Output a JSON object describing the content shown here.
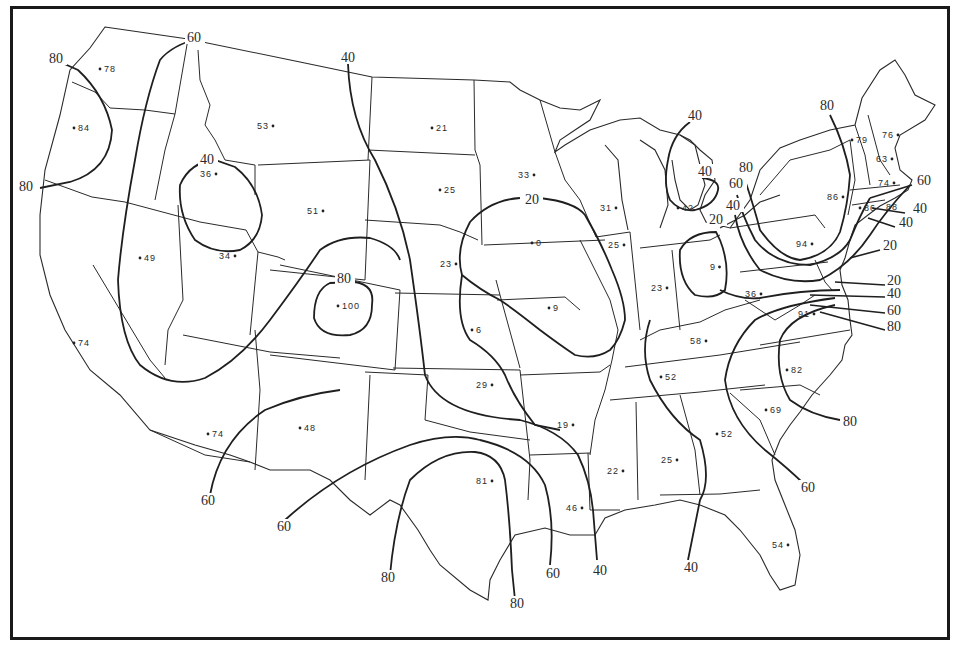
{
  "map": {
    "title": "",
    "contour_interval": 20,
    "contour_levels": [
      20,
      40,
      60,
      80,
      100
    ],
    "state_values": [
      {
        "state": "Washington",
        "value": "78",
        "x": 104,
        "y": 72,
        "dot": "left"
      },
      {
        "state": "Oregon",
        "value": "84",
        "x": 78,
        "y": 131,
        "dot": "left"
      },
      {
        "state": "California",
        "value": "74",
        "x": 78,
        "y": 346,
        "dot": "left"
      },
      {
        "state": "Nevada",
        "value": "49",
        "x": 144,
        "y": 261,
        "dot": "left"
      },
      {
        "state": "Idaho",
        "value": "36",
        "x": 200,
        "y": 177,
        "dot": "right"
      },
      {
        "state": "Montana",
        "value": "53",
        "x": 257,
        "y": 129,
        "dot": "right"
      },
      {
        "state": "Utah",
        "value": "34",
        "x": 219,
        "y": 259,
        "dot": "right"
      },
      {
        "state": "Wyoming",
        "value": "51",
        "x": 307,
        "y": 214,
        "dot": "right"
      },
      {
        "state": "Colorado",
        "value": "100",
        "x": 342,
        "y": 309,
        "dot": "left"
      },
      {
        "state": "Arizona",
        "value": "74",
        "x": 212,
        "y": 437,
        "dot": "left"
      },
      {
        "state": "New Mexico",
        "value": "48",
        "x": 304,
        "y": 431,
        "dot": "left"
      },
      {
        "state": "North Dakota",
        "value": "21",
        "x": 436,
        "y": 131,
        "dot": "left"
      },
      {
        "state": "South Dakota",
        "value": "25",
        "x": 444,
        "y": 193,
        "dot": "left"
      },
      {
        "state": "Nebraska",
        "value": "23",
        "x": 440,
        "y": 267,
        "dot": "right"
      },
      {
        "state": "Kansas",
        "value": "6",
        "x": 476,
        "y": 333,
        "dot": "left"
      },
      {
        "state": "Oklahoma",
        "value": "29",
        "x": 476,
        "y": 388,
        "dot": "right"
      },
      {
        "state": "Texas",
        "value": "81",
        "x": 476,
        "y": 484,
        "dot": "right"
      },
      {
        "state": "Minnesota",
        "value": "33",
        "x": 518,
        "y": 178,
        "dot": "right"
      },
      {
        "state": "Iowa",
        "value": "0",
        "x": 536,
        "y": 246,
        "dot": "left"
      },
      {
        "state": "Missouri",
        "value": "9",
        "x": 553,
        "y": 311,
        "dot": "left"
      },
      {
        "state": "Arkansas",
        "value": "19",
        "x": 557,
        "y": 428,
        "dot": "right"
      },
      {
        "state": "Louisiana",
        "value": "46",
        "x": 566,
        "y": 511,
        "dot": "right"
      },
      {
        "state": "Wisconsin",
        "value": "31",
        "x": 600,
        "y": 211,
        "dot": "right"
      },
      {
        "state": "Illinois",
        "value": "25",
        "x": 608,
        "y": 248,
        "dot": "right"
      },
      {
        "state": "Michigan",
        "value": "42",
        "x": 682,
        "y": 211,
        "dot": "left"
      },
      {
        "state": "Indiana",
        "value": "23",
        "x": 651,
        "y": 291,
        "dot": "right"
      },
      {
        "state": "Ohio",
        "value": "9",
        "x": 710,
        "y": 270,
        "dot": "right"
      },
      {
        "state": "Kentucky",
        "value": "58",
        "x": 690,
        "y": 344,
        "dot": "right"
      },
      {
        "state": "Tennessee",
        "value": "52",
        "x": 665,
        "y": 380,
        "dot": "left"
      },
      {
        "state": "Mississippi",
        "value": "22",
        "x": 607,
        "y": 474,
        "dot": "right"
      },
      {
        "state": "Alabama",
        "value": "25",
        "x": 661,
        "y": 463,
        "dot": "right"
      },
      {
        "state": "Georgia",
        "value": "52",
        "x": 721,
        "y": 437,
        "dot": "left"
      },
      {
        "state": "Florida",
        "value": "54",
        "x": 772,
        "y": 548,
        "dot": "right"
      },
      {
        "state": "South Carolina",
        "value": "69",
        "x": 770,
        "y": 413,
        "dot": "left"
      },
      {
        "state": "North Carolina",
        "value": "82",
        "x": 791,
        "y": 373,
        "dot": "left"
      },
      {
        "state": "Virginia",
        "value": "91",
        "x": 798,
        "y": 317,
        "dot": "right"
      },
      {
        "state": "West Virginia",
        "value": "36",
        "x": 745,
        "y": 297,
        "dot": "right"
      },
      {
        "state": "Pennsylvania",
        "value": "94",
        "x": 796,
        "y": 247,
        "dot": "right"
      },
      {
        "state": "New York",
        "value": "86",
        "x": 827,
        "y": 200,
        "dot": "right"
      },
      {
        "state": "Vermont",
        "value": "79",
        "x": 856,
        "y": 143,
        "dot": "left"
      },
      {
        "state": "New Hampshire",
        "value": "63",
        "x": 876,
        "y": 162,
        "dot": "right"
      },
      {
        "state": "Maine",
        "value": "76",
        "x": 882,
        "y": 138,
        "dot": "right"
      },
      {
        "state": "Massachusetts",
        "value": "74",
        "x": 878,
        "y": 186,
        "dot": "right"
      },
      {
        "state": "Connecticut",
        "value": "86",
        "x": 864,
        "y": 211,
        "dot": "left"
      },
      {
        "state": "Rhode Island",
        "value": "88",
        "x": 886,
        "y": 210,
        "dot": "none"
      }
    ],
    "contour_labels": [
      {
        "text": "60",
        "x": 187,
        "y": 42
      },
      {
        "text": "40",
        "x": 341,
        "y": 62
      },
      {
        "text": "80",
        "x": 49,
        "y": 63
      },
      {
        "text": "80",
        "x": 19,
        "y": 191
      },
      {
        "text": "40",
        "x": 200,
        "y": 164
      },
      {
        "text": "80",
        "x": 337,
        "y": 283
      },
      {
        "text": "20",
        "x": 525,
        "y": 204
      },
      {
        "text": "40",
        "x": 688,
        "y": 120
      },
      {
        "text": "40",
        "x": 698,
        "y": 176
      },
      {
        "text": "20",
        "x": 709,
        "y": 224
      },
      {
        "text": "80",
        "x": 739,
        "y": 172
      },
      {
        "text": "60",
        "x": 729,
        "y": 188
      },
      {
        "text": "40",
        "x": 726,
        "y": 210
      },
      {
        "text": "80",
        "x": 820,
        "y": 110
      },
      {
        "text": "60",
        "x": 917,
        "y": 185
      },
      {
        "text": "40",
        "x": 913,
        "y": 213
      },
      {
        "text": "40",
        "x": 899,
        "y": 227
      },
      {
        "text": "20",
        "x": 883,
        "y": 250
      },
      {
        "text": "20",
        "x": 887,
        "y": 285
      },
      {
        "text": "40",
        "x": 887,
        "y": 298
      },
      {
        "text": "60",
        "x": 887,
        "y": 315
      },
      {
        "text": "80",
        "x": 887,
        "y": 331
      },
      {
        "text": "80",
        "x": 843,
        "y": 426
      },
      {
        "text": "60",
        "x": 801,
        "y": 492
      },
      {
        "text": "60",
        "x": 201,
        "y": 505
      },
      {
        "text": "60",
        "x": 277,
        "y": 531
      },
      {
        "text": "80",
        "x": 381,
        "y": 582
      },
      {
        "text": "80",
        "x": 510,
        "y": 608
      },
      {
        "text": "60",
        "x": 546,
        "y": 578
      },
      {
        "text": "40",
        "x": 593,
        "y": 575
      },
      {
        "text": "40",
        "x": 684,
        "y": 572
      }
    ]
  }
}
